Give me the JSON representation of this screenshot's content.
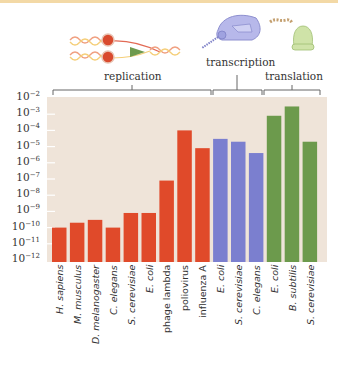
{
  "chart_data": {
    "type": "bar",
    "title": "",
    "xlabel": "",
    "ylabel": "",
    "yscale": "log",
    "ylim": [
      1e-12,
      0.01
    ],
    "yticks": [
      "10-2",
      "10-3",
      "10-4",
      "10-5",
      "10-6",
      "10-7",
      "10-8",
      "10-9",
      "10-10",
      "10-11",
      "10-12"
    ],
    "grid": false,
    "groups": [
      {
        "name": "replication",
        "color": "#e04a2a",
        "categories": [
          "H. sapiens",
          "M. musculus",
          "D. melanogaster",
          "C. elegans",
          "S. cerevisiae",
          "E. coli",
          "phage lambda",
          "poliovirus",
          "influenza A"
        ],
        "values": [
          1e-10,
          2e-10,
          3e-10,
          1e-10,
          8e-10,
          8e-10,
          8e-08,
          0.0001,
          8e-06
        ]
      },
      {
        "name": "transcription",
        "color": "#7b7fcf",
        "categories": [
          "E. coli",
          "S. cerevisiae",
          "C. elegans"
        ],
        "values": [
          3e-05,
          2e-05,
          4e-06
        ]
      },
      {
        "name": "translation",
        "color": "#6c9a4c",
        "categories": [
          "E. coli",
          "B. subtilis",
          "S. cerevisiae"
        ],
        "values": [
          0.0008,
          0.003,
          2e-05
        ]
      }
    ],
    "categories": [
      "H. sapiens",
      "M. musculus",
      "D. melanogaster",
      "C. elegans",
      "S. cerevisiae",
      "E. coli",
      "phage lambda",
      "poliovirus",
      "influenza A",
      "E. coli",
      "S. cerevisiae",
      "C. elegans",
      "E. coli",
      "B. subtilis",
      "S. cerevisiae"
    ],
    "italic": [
      true,
      true,
      true,
      true,
      true,
      true,
      false,
      false,
      false,
      true,
      true,
      true,
      true,
      true,
      true
    ]
  },
  "labels": {
    "replication": "replication",
    "transcription": "transcription",
    "translation": "translation"
  },
  "ytick_labels": [
    {
      "base": "10",
      "exp": "-2"
    },
    {
      "base": "10",
      "exp": "-3"
    },
    {
      "base": "10",
      "exp": "-4"
    },
    {
      "base": "10",
      "exp": "-5"
    },
    {
      "base": "10",
      "exp": "-6"
    },
    {
      "base": "10",
      "exp": "-7"
    },
    {
      "base": "10",
      "exp": "-8"
    },
    {
      "base": "10",
      "exp": "-9"
    },
    {
      "base": "10",
      "exp": "-10"
    },
    {
      "base": "10",
      "exp": "-11"
    },
    {
      "base": "10",
      "exp": "-12"
    }
  ],
  "colors": {
    "plot_bg": "#efe4d9",
    "replication": "#e04a2a",
    "transcription": "#7b7fcf",
    "translation": "#6c9a4c",
    "bracket": "#666666",
    "tick": "#ffffff"
  }
}
